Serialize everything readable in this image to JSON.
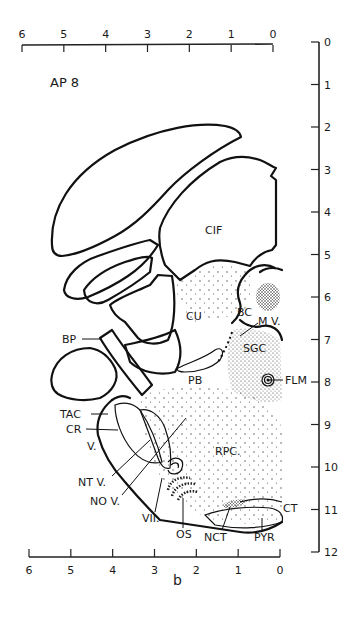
{
  "figure": {
    "section_label": "AP 8",
    "caption": "b",
    "top_scale": {
      "ticks": [
        "6",
        "5",
        "4",
        "3",
        "2",
        "1",
        "0"
      ]
    },
    "bottom_scale": {
      "ticks": [
        "6",
        "5",
        "4",
        "3",
        "2",
        "1",
        "0"
      ]
    },
    "right_scale": {
      "ticks": [
        "0",
        "1",
        "2",
        "3",
        "4",
        "5",
        "6",
        "7",
        "8",
        "9",
        "10",
        "11",
        "12"
      ]
    },
    "regions": {
      "cif": "CIF",
      "cu": "CU",
      "bc": "BC",
      "mv": "M V.",
      "sgc": "SGC",
      "pb": "PB",
      "flm": "FLM",
      "bp": "BP",
      "tac": "TAC",
      "cr": "CR",
      "v": "V.",
      "ntv": "NT V.",
      "nov": "NO V.",
      "vii": "VII.",
      "os": "OS",
      "nct": "NCT",
      "pyr": "PYR",
      "ct": "CT",
      "rpc": "RPC."
    },
    "colors": {
      "ink": "#111111",
      "paper": "#ffffff"
    }
  }
}
